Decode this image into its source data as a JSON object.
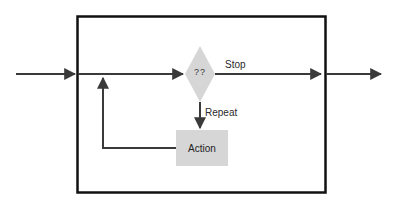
{
  "diagram": {
    "type": "flowchart-loop",
    "decision": {
      "label": "??",
      "shape": "diamond",
      "fill": "#d6d6d6"
    },
    "action": {
      "label": "Action",
      "shape": "rectangle",
      "fill": "#d6d6d6"
    },
    "edges": {
      "stop_label": "Stop",
      "repeat_label": "Repeat"
    },
    "colors": {
      "line": "#3a3a3a",
      "box_border": "#111111",
      "shape_fill": "#d6d6d6"
    }
  }
}
